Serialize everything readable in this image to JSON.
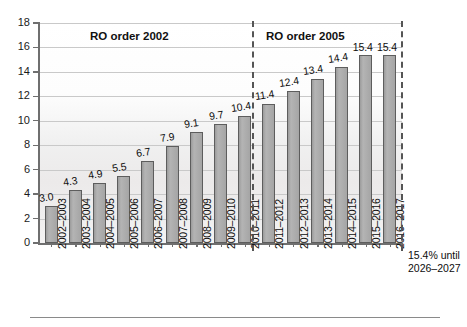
{
  "chart_data": {
    "type": "bar",
    "title": "",
    "xlabel": "",
    "ylabel": "",
    "ylim": [
      0,
      18
    ],
    "ytick_step": 2,
    "yticks": [
      "0",
      "2",
      "4",
      "6",
      "8",
      "10",
      "12",
      "14",
      "16",
      "18"
    ],
    "grid": true,
    "legend": "none",
    "categories": [
      "2002–2003",
      "2003–2004",
      "2004–2005",
      "2005–2006",
      "2006–2007",
      "2007–2008",
      "2008–2009",
      "2009–2010",
      "2010–2011",
      "2011–2012",
      "2012–2013",
      "2013–2014",
      "2014–2015",
      "2015–2016",
      "2016–2017"
    ],
    "values": [
      3.0,
      4.3,
      4.9,
      5.5,
      6.7,
      7.9,
      9.1,
      9.7,
      10.4,
      11.4,
      12.4,
      13.4,
      14.4,
      15.4,
      15.4
    ],
    "value_labels": [
      "3.0",
      "4.3",
      "4.9",
      "5.5",
      "6.7",
      "7.9",
      "9.1",
      "9.7",
      "10.4",
      "11.4",
      "12.4",
      "13.4",
      "14.4",
      "15.4",
      "15.4"
    ],
    "bar_color": "#a9a9a9",
    "bar_border_color": "#5d5d5d",
    "annotations": [
      {
        "name": "section-2002",
        "text": "RO order 2002",
        "span": [
          0,
          8
        ]
      },
      {
        "name": "section-2005",
        "text": "RO order 2005",
        "span": [
          9,
          14
        ]
      },
      {
        "name": "future-note",
        "line1": "15.4% until",
        "line2": "2026–2027"
      }
    ]
  },
  "sections": {
    "first": "RO order 2002",
    "second": "RO order 2005"
  },
  "note": {
    "line1": "15.4% until",
    "line2": "2026–2027"
  }
}
